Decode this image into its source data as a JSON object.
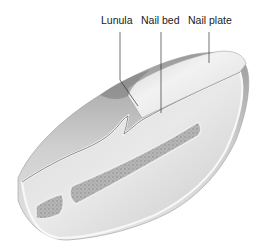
{
  "diagram": {
    "labels": [
      {
        "id": "lunula",
        "text": "Lunula"
      },
      {
        "id": "nail_bed",
        "text": "Nail bed"
      },
      {
        "id": "nail_plate",
        "text": "Nail plate"
      }
    ],
    "colors": {
      "background": "#ffffff",
      "skin_dark": "#8a8a8a",
      "skin_mid": "#c4c4c4",
      "skin_light": "#e8e8e8",
      "bone": "#a8a8a8",
      "leader_line": "#333333"
    }
  }
}
